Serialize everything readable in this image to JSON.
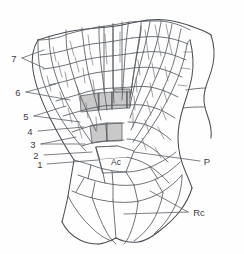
{
  "figure": {
    "name": "apical-meristem-diagram",
    "type": "botanical line drawing",
    "background_color": "#fefefe",
    "line_color": "#555a60",
    "shading_color": "#c9c9c9"
  },
  "labels": {
    "left_series": [
      {
        "id": "label-7",
        "text": "7",
        "x": 14,
        "y": 58,
        "branched": true
      },
      {
        "id": "label-6",
        "text": "6",
        "x": 18,
        "y": 92,
        "branched": true
      },
      {
        "id": "label-5",
        "text": "5",
        "x": 26,
        "y": 116,
        "branched": true
      },
      {
        "id": "label-4",
        "text": "4",
        "x": 30,
        "y": 131,
        "branched": false
      },
      {
        "id": "label-3",
        "text": "3",
        "x": 33,
        "y": 144,
        "branched": false
      },
      {
        "id": "label-2",
        "text": "2",
        "x": 36,
        "y": 155,
        "branched": false
      },
      {
        "id": "label-1",
        "text": "1",
        "x": 40,
        "y": 164,
        "branched": false
      }
    ],
    "right_series": [
      {
        "id": "label-p",
        "text": "P",
        "x": 204,
        "y": 161,
        "meaning": "procambium"
      },
      {
        "id": "label-rc",
        "text": "Rc",
        "x": 192,
        "y": 212,
        "meaning": "root cap"
      }
    ],
    "center": [
      {
        "id": "label-ac",
        "text": "Ac",
        "x": 117,
        "y": 163,
        "meaning": "apical cell"
      }
    ]
  },
  "legend_keys": {
    "Ac": "apical cell",
    "P": "procambium",
    "Rc": "root cap",
    "1-7": "successive merophyte derivative generations"
  }
}
